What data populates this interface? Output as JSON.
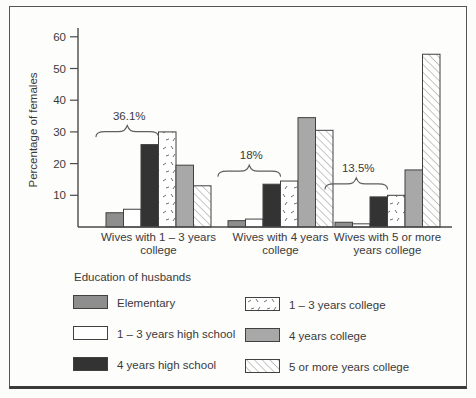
{
  "chart_data": {
    "type": "bar",
    "title": "",
    "xlabel": "",
    "ylabel": "Percentage of females",
    "ylim": [
      0,
      60
    ],
    "yticks": [
      10,
      20,
      30,
      40,
      50,
      60
    ],
    "grid": false,
    "legend_title": "Education of husbands",
    "legend_position": "bottom",
    "categories": [
      "Wives with 1 – 3 years college",
      "Wives with 4 years college",
      "Wives with 5 or more years college"
    ],
    "category_label_lines": [
      [
        "Wives with 1 – 3 years",
        "college"
      ],
      [
        "Wives with 4 years",
        "college"
      ],
      [
        "Wives with 5 or more",
        "years college"
      ]
    ],
    "series": [
      {
        "name": "Elementary",
        "fill": "#8e8e8e",
        "values": [
          4.5,
          2,
          1.5
        ]
      },
      {
        "name": "1 – 3 years high school",
        "fill": "#ffffff",
        "values": [
          5.6,
          2.5,
          1
        ]
      },
      {
        "name": "4 years high school",
        "fill": "#333333",
        "values": [
          26,
          13.5,
          9.5
        ]
      },
      {
        "name": "1 – 3 years college",
        "fill": "pattern:speckle",
        "values": [
          30,
          14.5,
          10
        ]
      },
      {
        "name": "4 years college",
        "fill": "#a8a8a8",
        "values": [
          19.5,
          34.5,
          18
        ]
      },
      {
        "name": "5 or more years college",
        "fill": "pattern:hatch",
        "values": [
          13,
          30.5,
          54.5
        ]
      }
    ],
    "annotations": [
      {
        "group": 0,
        "label": "36.1%",
        "covers_series": [
          0,
          1,
          2
        ]
      },
      {
        "group": 1,
        "label": "18%",
        "covers_series": [
          0,
          1,
          2
        ]
      },
      {
        "group": 2,
        "label": "13.5%",
        "covers_series": [
          0,
          1,
          2
        ]
      }
    ],
    "colors": {
      "bar_outline": "#414141",
      "axis": "#4a4a4a",
      "text": "#3a3a3a",
      "solid_dark": "#333333",
      "solid_medium": "#8e8e8e",
      "solid_light": "#a8a8a8",
      "white": "#ffffff"
    }
  }
}
